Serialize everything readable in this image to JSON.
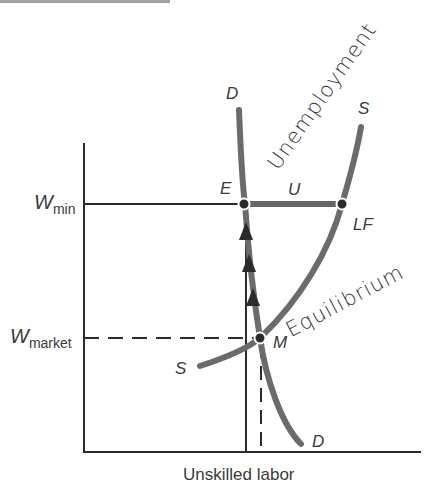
{
  "diagram": {
    "type": "minimum-wage labor market diagram",
    "x_axis_label": "Unskilled labor",
    "y_axis_ticks": [
      {
        "id": "w_min",
        "base": "W",
        "subscript": "min"
      },
      {
        "id": "w_market",
        "base": "W",
        "subscript": "market"
      }
    ],
    "curves": [
      {
        "name": "demand",
        "label_top": "D",
        "label_bottom": "D"
      },
      {
        "name": "supply",
        "label_top": "S",
        "label_bottom": "S"
      }
    ],
    "points": {
      "E": "E",
      "U": "U",
      "LF": "LF",
      "M": "M"
    },
    "handwritten_annotations": {
      "unemployment": "Unemployment",
      "equilibrium": "Equilibrium"
    },
    "colors": {
      "curve": "#6b6b6b",
      "axis": "#2b2b2b",
      "text": "#3a3a3a"
    }
  }
}
